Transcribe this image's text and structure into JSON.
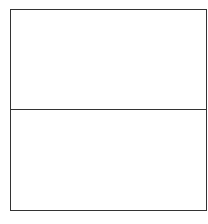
{
  "diagram": {
    "type": "two-panel-box",
    "sections": [
      {
        "id": "top",
        "label": ""
      },
      {
        "id": "bottom",
        "label": ""
      }
    ],
    "colors": {
      "border": "#333333",
      "background": "#ffffff"
    }
  }
}
